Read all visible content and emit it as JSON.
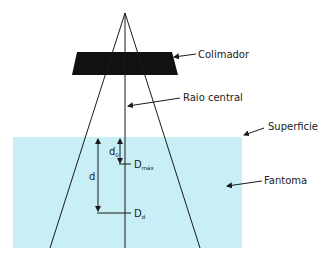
{
  "diagram": {
    "labels": {
      "collimator": "Colimador",
      "central_ray": "Raio central",
      "surface": "Superficie",
      "phantom": "Fantoma",
      "d0_main": "d",
      "d0_sub": "0",
      "d": "d",
      "dmax_main": "D",
      "dmax_sub": "máx",
      "dd_main": "D",
      "dd_sub": "d"
    },
    "colors": {
      "phantom_fill": "#c8eef6",
      "collimator_fill": "#111111",
      "line": "#1a1a1a"
    }
  }
}
